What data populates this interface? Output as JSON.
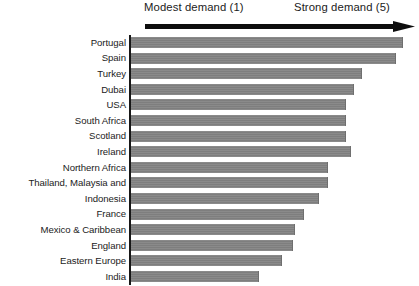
{
  "chart_data": {
    "type": "bar",
    "title": "",
    "subtitle": "",
    "orientation": "horizontal",
    "xlabel": "",
    "ylabel": "",
    "xlim": [
      0,
      5
    ],
    "grid": false,
    "legend": null,
    "axis_annotation": {
      "left_label": "Modest demand (1)",
      "right_label": "Strong demand (5)",
      "arrow": "right-arrow-icon"
    },
    "categories": [
      "Portugal",
      "Spain",
      "Turkey",
      "Dubai",
      "USA",
      "South Africa",
      "Scotland",
      "Ireland",
      "Northern Africa",
      "Thailand, Malaysia and",
      "Indonesia",
      "France",
      "Mexico & Caribbean",
      "England",
      "Eastern Europe",
      "India"
    ],
    "values": [
      4.7,
      4.6,
      4.0,
      3.9,
      3.8,
      3.8,
      3.8,
      3.8,
      3.4,
      3.4,
      3.2,
      3.0,
      2.8,
      2.6,
      2.6,
      2.2
    ],
    "bar_pixel_widths": [
      272,
      265,
      231,
      223,
      215,
      215,
      215,
      220,
      197,
      197,
      188,
      173,
      164,
      162,
      151,
      128
    ],
    "bar_color": "#808080",
    "axis_color": "#171717",
    "text_color": "#1b1b1b",
    "background_color": "#ffffff"
  }
}
